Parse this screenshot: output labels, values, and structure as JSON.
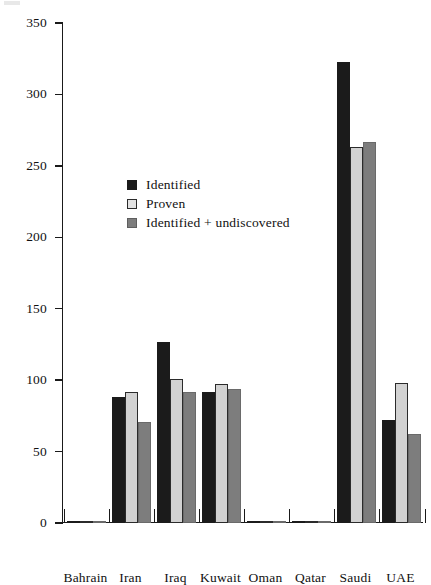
{
  "chart_data": {
    "type": "bar",
    "title": "",
    "subtitle": "",
    "xlabel": "",
    "ylabel": "",
    "ylim": [
      0,
      350
    ],
    "ytick_values": [
      0,
      50,
      100,
      150,
      200,
      250,
      300,
      350
    ],
    "ytick_labels": [
      "0",
      "50",
      "100",
      "150",
      "200",
      "250",
      "300",
      "350"
    ],
    "grid": false,
    "legend_position": "inside-upper-left",
    "categories": [
      "Bahrain",
      "Iran",
      "Iraq",
      "Kuwait",
      "Oman",
      "Qatar",
      "Saudi",
      "UAE"
    ],
    "series": [
      {
        "name": "Identified",
        "color": "#1b1b1b",
        "values": [
          0.3,
          88,
          127,
          92,
          0.6,
          1.2,
          323,
          72
        ]
      },
      {
        "name": "Proven",
        "color": "#d2d2d2",
        "values": [
          0.3,
          92,
          101,
          97,
          0.6,
          1.2,
          263,
          98
        ]
      },
      {
        "name": "Identified + undiscovered",
        "color": "#7d7d7d",
        "values": [
          0.3,
          71,
          92,
          94,
          0.6,
          1.2,
          267,
          62
        ]
      }
    ]
  },
  "legend": {
    "entries": [
      {
        "label": "Identified"
      },
      {
        "label": "Proven"
      },
      {
        "label": "Identified + undiscovered"
      }
    ]
  }
}
